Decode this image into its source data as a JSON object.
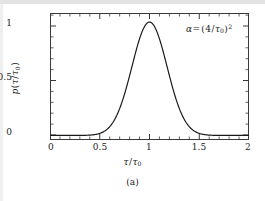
{
  "figure": {
    "caption": "(a)",
    "annotation": {
      "symbol": "α",
      "equals": "=",
      "open": "(",
      "numerator": "4",
      "slash": "/",
      "tau": "τ",
      "tau_sub": "0",
      "close": ")",
      "exponent": "2",
      "plain": "α = (4/τ₀)²"
    },
    "background_color": "#ffffff",
    "curve_color": "#1a1a1a",
    "frame_color": "#3a3a3a"
  },
  "axes": {
    "xlabel": {
      "tau": "τ",
      "slash": "/",
      "tau0_base": "τ",
      "tau0_sub": "0",
      "plain": "τ/τ₀"
    },
    "ylabel": {
      "p": "p",
      "open": "(",
      "tau": "τ",
      "slash": "/",
      "tau0_base": "τ",
      "tau0_sub": "0",
      "close": ")",
      "plain": "p(τ/τ₀)"
    },
    "xticks": [
      "0",
      "0.5",
      "1",
      "1.5",
      "2"
    ],
    "yticks": [
      "0",
      "0.5",
      "1"
    ]
  },
  "chart_data": {
    "type": "line",
    "title": "",
    "xlabel": "τ/τ₀",
    "ylabel": "p(τ/τ₀)",
    "xlim": [
      0,
      2
    ],
    "ylim": [
      -0.04,
      1.08
    ],
    "xticks": [
      0,
      0.5,
      1,
      1.5,
      2
    ],
    "yticks": [
      0,
      0.5,
      1
    ],
    "xminor_step": 0.1,
    "yminor_step": 0.1,
    "grid": false,
    "legend": false,
    "annotations": [
      {
        "text": "α = (4/τ₀)²",
        "x": 1.62,
        "y": 0.93
      }
    ],
    "series": [
      {
        "name": "p(τ/τ₀)",
        "formula": "exp(-16*(x-1)^2)",
        "color": "#1a1a1a",
        "linewidth": 1.2,
        "x": [
          0.0,
          0.05,
          0.1,
          0.15,
          0.2,
          0.25,
          0.3,
          0.35,
          0.4,
          0.45,
          0.5,
          0.55,
          0.6,
          0.65,
          0.7,
          0.75,
          0.8,
          0.85,
          0.9,
          0.95,
          1.0,
          1.05,
          1.1,
          1.15,
          1.2,
          1.25,
          1.3,
          1.35,
          1.4,
          1.45,
          1.5,
          1.55,
          1.6,
          1.65,
          1.7,
          1.75,
          1.8,
          1.85,
          1.9,
          1.95,
          2.0
        ],
        "y": [
          0.0,
          0.0,
          0.0,
          0.0,
          0.0,
          0.0,
          0.0,
          0.002,
          0.006,
          0.015,
          0.018,
          0.041,
          0.077,
          0.133,
          0.213,
          0.368,
          0.527,
          0.698,
          0.852,
          0.961,
          1.0,
          0.961,
          0.852,
          0.698,
          0.527,
          0.368,
          0.213,
          0.133,
          0.077,
          0.041,
          0.018,
          0.015,
          0.006,
          0.002,
          0.0,
          0.0,
          0.0,
          0.0,
          0.0,
          0.0,
          0.0
        ]
      }
    ]
  }
}
